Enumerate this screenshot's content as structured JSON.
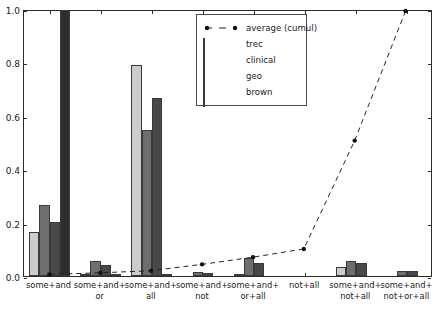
{
  "chart_data": {
    "type": "bar",
    "title": "",
    "xlabel": "",
    "ylabel": "",
    "ylim": [
      0.0,
      1.0
    ],
    "xlim": [
      0,
      8
    ],
    "grid": false,
    "legend_position": "upper center",
    "ytick_labels": [
      "0.0",
      "0.2",
      "0.4",
      "0.6",
      "0.8",
      "1.0"
    ],
    "ytick_values": [
      0.0,
      0.2,
      0.4,
      0.6,
      0.8,
      1.0
    ],
    "categories": [
      "some+and",
      "some+and+\nor",
      "some+and+\nall",
      "some+and+\nnot",
      "some+and+\nor+all",
      "not+all",
      "some+and+\nnot+all",
      "some+and+\nnot+or+all"
    ],
    "category_lines": [
      [
        "some+and"
      ],
      [
        "some+and+",
        "or"
      ],
      [
        "some+and+",
        "all"
      ],
      [
        "some+and+",
        "not"
      ],
      [
        "some+and+",
        "or+all"
      ],
      [
        "not+all"
      ],
      [
        "some+and+",
        "not+all"
      ],
      [
        "some+and+",
        "not+or+all"
      ]
    ],
    "series": [
      {
        "name": "trec",
        "color": "#cccccc",
        "values": [
          0.166,
          0.002,
          0.79,
          0.0,
          0.004,
          0.0,
          0.035,
          0.0
        ]
      },
      {
        "name": "clinical",
        "color": "#6e6e6e",
        "values": [
          0.265,
          0.055,
          0.547,
          0.015,
          0.068,
          0.0,
          0.055,
          0.019
        ]
      },
      {
        "name": "geo",
        "color": "#494949",
        "values": [
          0.203,
          0.04,
          0.665,
          0.011,
          0.047,
          0.0,
          0.047,
          0.018
        ]
      },
      {
        "name": "brown",
        "color": "#2e2e2e",
        "values": [
          0.995,
          0.003,
          0.009,
          0.0,
          0.0,
          0.0,
          0.0,
          0.0
        ]
      }
    ],
    "line_series": {
      "name": "average (cumul)",
      "color": "#222222",
      "linestyle": "dashed",
      "marker": "circle",
      "x": [
        0,
        1,
        2,
        3,
        4,
        5,
        6,
        7
      ],
      "values": [
        0.006,
        0.012,
        0.02,
        0.044,
        0.071,
        0.102,
        0.511,
        1.0
      ]
    }
  },
  "legend": {
    "entries": [
      {
        "label": "average (cumul)",
        "kind": "line"
      },
      {
        "label": "trec",
        "kind": "patch"
      },
      {
        "label": "clinical",
        "kind": "patch"
      },
      {
        "label": "geo",
        "kind": "patch"
      },
      {
        "label": "brown",
        "kind": "patch"
      }
    ]
  }
}
